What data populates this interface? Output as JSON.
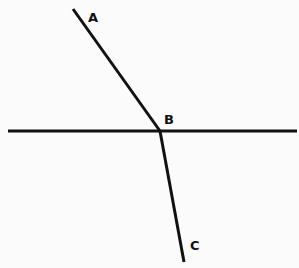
{
  "diagram": {
    "labels": {
      "a": "A",
      "b": "B",
      "c": "C"
    },
    "line_color": "#111111",
    "background": "#fbfbfb",
    "points": {
      "A": [
        73,
        9
      ],
      "B": [
        160,
        131
      ],
      "C": [
        184,
        262
      ]
    },
    "horizontal_line": {
      "x1": 8,
      "x2": 297,
      "y": 131
    }
  }
}
